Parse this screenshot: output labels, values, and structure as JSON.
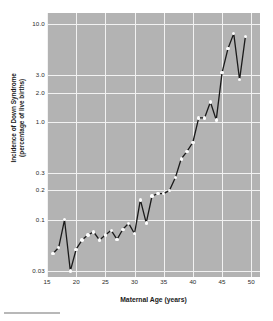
{
  "chart_data": {
    "type": "line",
    "title": "",
    "subtitle": "",
    "xlabel": "Maternal Age (years)",
    "ylabel": "Incidence of Down Syndrome (percentage of live births)",
    "ylabel_line1": "Incidence of Down Syndrome",
    "ylabel_line2": "(percentage of live births)",
    "xscale": "linear",
    "yscale": "log",
    "xlim": [
      15,
      51.5
    ],
    "ylim": [
      0.026,
      13.0
    ],
    "xticks": [
      15,
      20,
      25,
      30,
      35,
      40,
      45,
      50
    ],
    "xticklabels": [
      "15",
      "20",
      "25",
      "30",
      "35",
      "40",
      "45",
      "50"
    ],
    "yticks": [
      0.03,
      0.1,
      0.2,
      0.3,
      1.0,
      2.0,
      3.0,
      10.0
    ],
    "yticklabels": [
      "0.03",
      "0.1",
      "0.2",
      "0.3",
      "1.0",
      "2.0",
      "3.0",
      "10.0"
    ],
    "grid": true,
    "grid_color": "#f2f2f2",
    "panel_color": "#b3b3b3",
    "line_color": "#1a1a1a",
    "marker_color": "#fdfdfd",
    "legend": "none",
    "legend_position": "none",
    "x": [
      16,
      17,
      18,
      19,
      20,
      21,
      22,
      23,
      24,
      25,
      26,
      27,
      28,
      29,
      30,
      31,
      32,
      33,
      34,
      35,
      36,
      37,
      38,
      39,
      40,
      41,
      42,
      43,
      44,
      45,
      46,
      47,
      48,
      49
    ],
    "values": [
      0.045,
      0.052,
      0.1,
      0.03,
      0.05,
      0.062,
      0.07,
      0.075,
      0.062,
      0.07,
      0.078,
      0.063,
      0.08,
      0.092,
      0.072,
      0.16,
      0.093,
      0.175,
      0.185,
      0.185,
      0.2,
      0.27,
      0.42,
      0.5,
      0.62,
      1.1,
      1.1,
      1.6,
      1.05,
      3.2,
      5.6,
      8.0,
      2.7,
      7.5
    ],
    "series": [
      {
        "name": "Incidence of Down Syndrome",
        "x": [
          16,
          17,
          18,
          19,
          20,
          21,
          22,
          23,
          24,
          25,
          26,
          27,
          28,
          29,
          30,
          31,
          32,
          33,
          34,
          35,
          36,
          37,
          38,
          39,
          40,
          41,
          42,
          43,
          44,
          45,
          46,
          47,
          48,
          49
        ],
        "values": [
          0.045,
          0.052,
          0.1,
          0.03,
          0.05,
          0.062,
          0.07,
          0.075,
          0.062,
          0.07,
          0.078,
          0.063,
          0.08,
          0.092,
          0.072,
          0.16,
          0.093,
          0.175,
          0.185,
          0.185,
          0.2,
          0.27,
          0.42,
          0.5,
          0.62,
          1.1,
          1.1,
          1.6,
          1.05,
          3.2,
          5.6,
          8.0,
          2.7,
          7.5
        ]
      }
    ]
  }
}
